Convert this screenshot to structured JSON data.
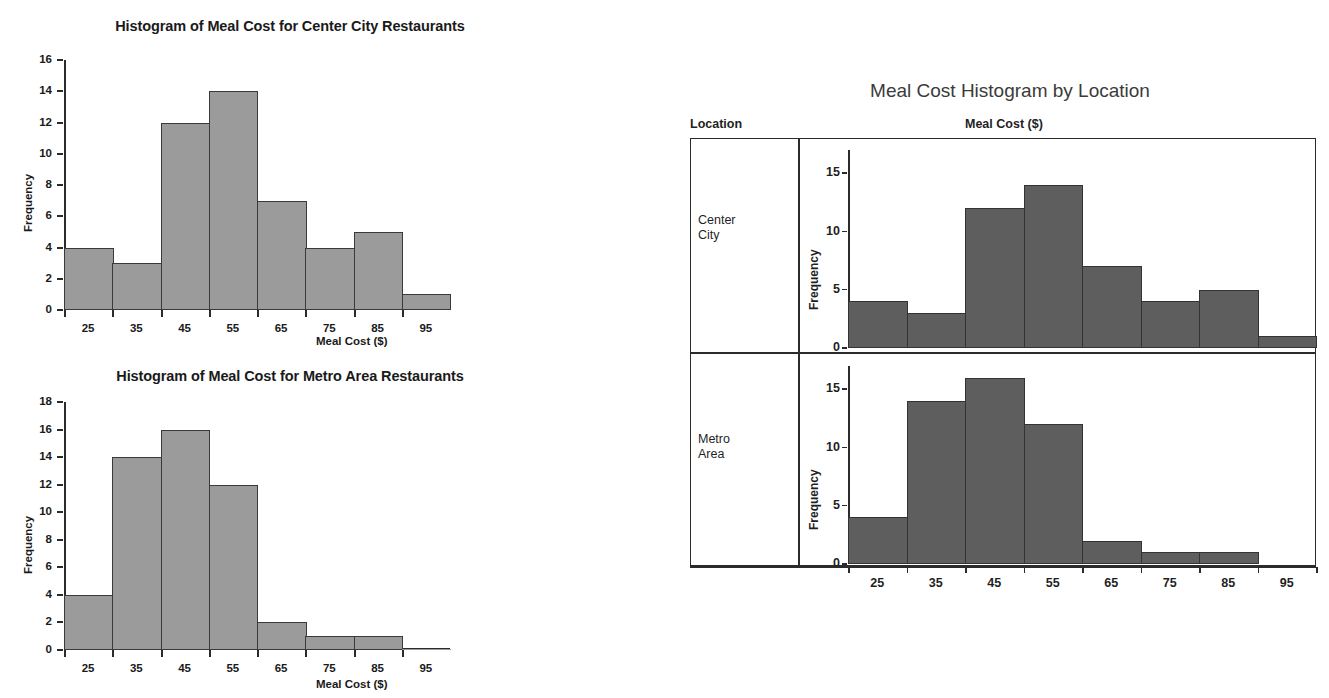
{
  "chart_data": [
    {
      "id": "center-city-simple",
      "type": "bar",
      "title": "Histogram of Meal Cost for Center City Restaurants",
      "xlabel": "Meal Cost ($)",
      "ylabel": "Frequency",
      "categories": [
        "25",
        "35",
        "45",
        "55",
        "65",
        "75",
        "85",
        "95"
      ],
      "values": [
        4,
        3,
        12,
        14,
        7,
        4,
        5,
        1
      ],
      "yticks": [
        0,
        2,
        4,
        6,
        8,
        10,
        12,
        14,
        16
      ],
      "ylim": [
        0,
        16
      ],
      "bar_color": "#9b9b9b",
      "grid": false,
      "legend": "none"
    },
    {
      "id": "metro-area-simple",
      "type": "bar",
      "title": "Histogram of Meal Cost for Metro Area Restaurants",
      "xlabel": "Meal Cost ($)",
      "ylabel": "Frequency",
      "categories": [
        "25",
        "35",
        "45",
        "55",
        "65",
        "75",
        "85",
        "95"
      ],
      "values": [
        4,
        14,
        16,
        12,
        2,
        1,
        1,
        0
      ],
      "yticks": [
        0,
        2,
        4,
        6,
        8,
        10,
        12,
        14,
        16,
        18
      ],
      "ylim": [
        0,
        18
      ],
      "bar_color": "#9b9b9b",
      "grid": false,
      "legend": "none"
    },
    {
      "id": "paneled-by-location",
      "type": "bar",
      "title": "Meal Cost Histogram by Location",
      "panel_var_label": "Location",
      "xlabel": "Meal Cost ($)",
      "ylabel": "Frequency",
      "categories": [
        "25",
        "35",
        "45",
        "55",
        "65",
        "75",
        "85",
        "95"
      ],
      "yticks": [
        0,
        5,
        10,
        15
      ],
      "ylim": [
        0,
        17
      ],
      "bar_color": "#5e5e5e",
      "grid": false,
      "legend": "none",
      "series": [
        {
          "name": "Center City",
          "name_line1": "Center",
          "name_line2": "City",
          "values": [
            4,
            3,
            12,
            14,
            7,
            4,
            5,
            1
          ]
        },
        {
          "name": "Metro Area",
          "name_line1": "Metro",
          "name_line2": "Area",
          "values": [
            4,
            14,
            16,
            12,
            2,
            1,
            1,
            0
          ]
        }
      ]
    }
  ]
}
